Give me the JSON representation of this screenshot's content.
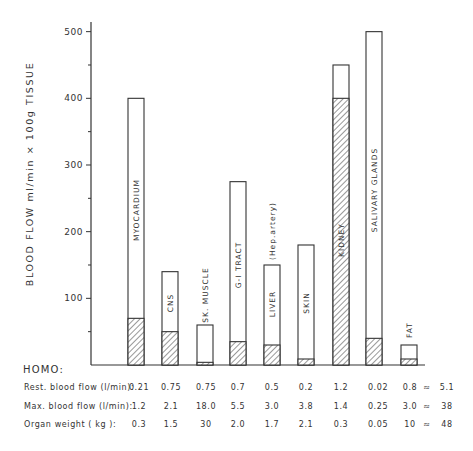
{
  "chart_data": {
    "type": "bar",
    "title": "",
    "xlabel": "",
    "ylabel": "BLOOD  FLOW  ml/min × 100g  TISSUE",
    "ylim": [
      0,
      500
    ],
    "yticks": [
      100,
      200,
      300,
      400,
      500
    ],
    "yticks_minor": [
      50,
      150,
      250,
      350,
      450
    ],
    "grid": false,
    "legend": null,
    "stacked_note": "Open bar = maximal blood flow; hatched portion = resting blood flow",
    "categories": [
      "MYOCARDIUM",
      "CNS",
      "SK. MUSCLE",
      "G-I TRACT",
      "LIVER (Hep.artery)",
      "SKIN",
      "KIDNEY",
      "SALIVARY GLANDS",
      "FAT"
    ],
    "series": [
      {
        "name": "Maximal blood flow (open bar)",
        "values": [
          400,
          140,
          60,
          275,
          150,
          180,
          450,
          500,
          30
        ]
      },
      {
        "name": "Resting blood flow (hatched)",
        "values": [
          70,
          50,
          4,
          35,
          30,
          9,
          400,
          40,
          9
        ]
      }
    ],
    "bars": [
      {
        "label": "MYOCARDIUM",
        "max": 400,
        "rest": 70,
        "label_inside": true,
        "label_y": 210
      },
      {
        "label": "CNS",
        "max": 140,
        "rest": 50,
        "label_inside": true,
        "label_y": 303
      },
      {
        "label": "SK. MUSCLE",
        "max": 60,
        "rest": 4,
        "label_inside": false,
        "label_y": 295
      },
      {
        "label": "G-I TRACT",
        "max": 275,
        "rest": 35,
        "label_inside": true,
        "label_y": 265
      },
      {
        "label": "LIVER",
        "sublabel": "(Hep.artery)",
        "max": 150,
        "rest": 30,
        "label_inside": true,
        "label_y": 304,
        "sublabel_y": 231
      },
      {
        "label": "SKIN",
        "max": 180,
        "rest": 9,
        "label_inside": true,
        "label_y": 303
      },
      {
        "label": "KIDNEY",
        "max": 450,
        "rest": 400,
        "label_inside": true,
        "label_y": 240
      },
      {
        "label": "SALIVARY GLANDS",
        "max": 500,
        "rest": 40,
        "label_inside": true,
        "label_y": 190
      },
      {
        "label": "FAT",
        "max": 30,
        "rest": 9,
        "label_inside": false,
        "label_y": 330
      }
    ],
    "table": {
      "heading": "HOMO:",
      "rows": [
        {
          "label": "Rest. blood flow (l/min):",
          "values": [
            "0.21",
            "0.75",
            "0.75",
            "0.7",
            "0.5",
            "0.2",
            "1.2",
            "0.02",
            "0.8"
          ],
          "approx": "≈",
          "total": "5.1"
        },
        {
          "label": "Max. blood flow (l/min):",
          "values": [
            "1.2",
            "2.1",
            "18.0",
            "5.5",
            "3.0",
            "3.8",
            "1.4",
            "0.25",
            "3.0"
          ],
          "approx": "≈",
          "total": "38"
        },
        {
          "label": "Organ  weight  (  kg  ):",
          "values": [
            "0.3",
            "1.5",
            "30",
            "2.0",
            "1.7",
            "2.1",
            "0.3",
            "0.05",
            "10"
          ],
          "approx": "≈",
          "total": "48"
        }
      ]
    }
  },
  "colors": {
    "ink": "#333333",
    "background": "#ffffff"
  }
}
